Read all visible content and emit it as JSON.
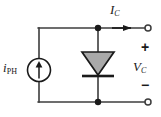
{
  "figure": {
    "type": "schematic-diagram",
    "width": 161,
    "height": 117,
    "background_color": "#ffffff"
  },
  "labels": {
    "current_source": {
      "symbol": "i",
      "subscript": "PH",
      "full": "iPH"
    },
    "terminal_current": {
      "symbol": "I",
      "subscript": "C",
      "full": "IC"
    },
    "terminal_voltage": {
      "symbol": "V",
      "subscript": "C",
      "full": "VC"
    },
    "polarity_positive": "+",
    "polarity_negative": "−"
  },
  "components": [
    {
      "id": "current-source",
      "type": "current-source",
      "label": "iPH",
      "arrow_direction": "up",
      "cx": 39,
      "cy": 70,
      "r": 11.5
    },
    {
      "id": "diode",
      "type": "diode",
      "orientation": "cathode-down",
      "fill_color": "#a9a9a9",
      "stroke_color": "#1a1a1a",
      "x_center": 98,
      "y_top": 52,
      "y_bottom": 75
    },
    {
      "id": "terminal-top",
      "type": "open-terminal",
      "x": 148,
      "y": 28
    },
    {
      "id": "terminal-bottom",
      "type": "open-terminal",
      "x": 148,
      "y": 102
    },
    {
      "id": "node-top",
      "type": "junction-dot",
      "x": 98,
      "y": 28
    },
    {
      "id": "node-bottom",
      "type": "junction-dot",
      "x": 98,
      "y": 102
    }
  ],
  "colors": {
    "wire": "#3c3c3c",
    "ink": "#1a1a1a",
    "diode_fill": "#a9a9a9"
  }
}
